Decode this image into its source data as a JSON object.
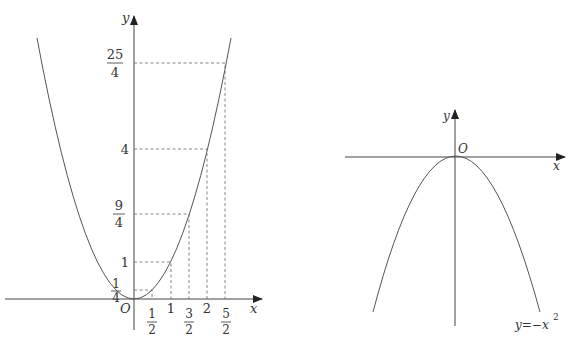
{
  "figures": [
    {
      "id": "left",
      "function": "y = x^2",
      "axis_labels": {
        "x": "x",
        "y": "y",
        "origin": "O"
      },
      "x_ticks": [
        {
          "num": "1",
          "den": "2",
          "value": 0.5
        },
        {
          "text": "1",
          "value": 1
        },
        {
          "num": "3",
          "den": "2",
          "value": 1.5
        },
        {
          "text": "2",
          "value": 2
        },
        {
          "num": "5",
          "den": "2",
          "value": 2.5
        }
      ],
      "y_ticks": [
        {
          "num": "1",
          "den": "4",
          "value": 0.25
        },
        {
          "text": "1",
          "value": 1
        },
        {
          "num": "9",
          "den": "4",
          "value": 2.25
        },
        {
          "text": "4",
          "value": 4
        },
        {
          "num": "25",
          "den": "4",
          "value": 6.25
        }
      ]
    },
    {
      "id": "right",
      "function": "y = -x^2",
      "axis_labels": {
        "x": "x",
        "y": "y",
        "origin": "O"
      },
      "curve_label": {
        "base": "y=−x",
        "exp": "2"
      }
    }
  ],
  "colors": {
    "line": "#444444",
    "dash": "#666666",
    "text": "#333333"
  }
}
